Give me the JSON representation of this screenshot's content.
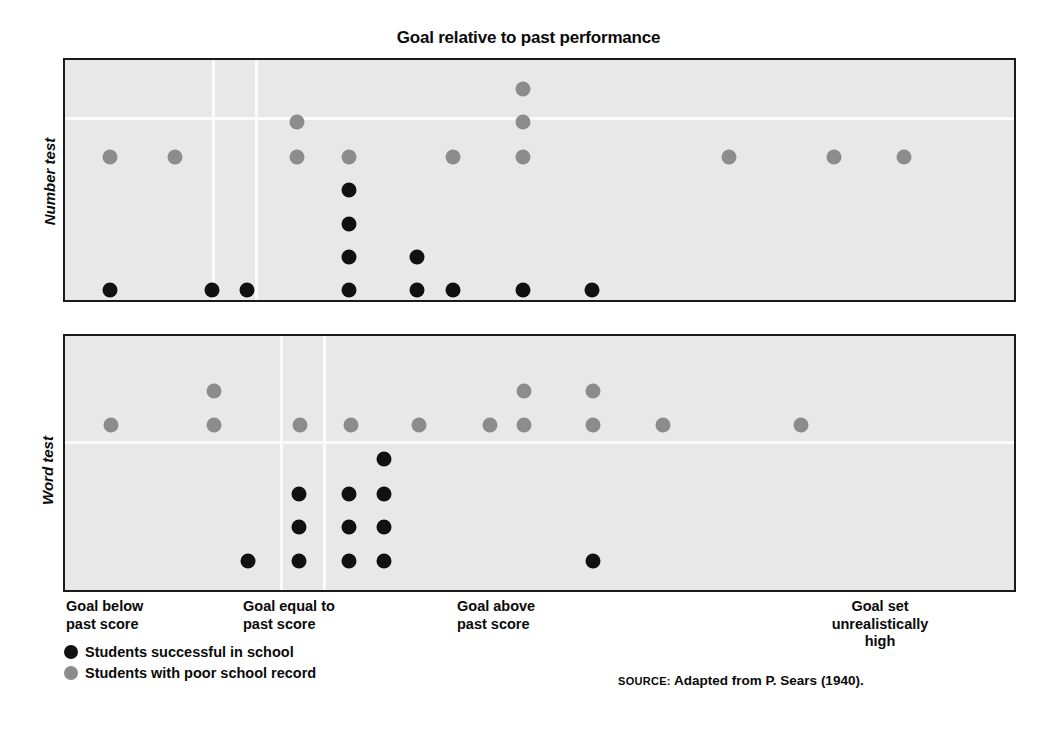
{
  "figure": {
    "title": "Goal relative to past performance",
    "source_kicker": "SOURCE:",
    "source_text": "Adapted from P. Sears (1940)."
  },
  "legend": {
    "items": [
      {
        "key": "success",
        "label": "Students successful in school",
        "color": "#111111"
      },
      {
        "key": "poor",
        "label": "Students with poor school record",
        "color": "#8c8c8c"
      }
    ]
  },
  "axis": {
    "y_labels": [
      "Number test",
      "Word test"
    ],
    "x_categories": [
      "Goal below\npast score",
      "Goal equal to\npast score",
      "Goal above\npast score",
      "Goal set\nunrealistically\nhigh"
    ]
  },
  "colors": {
    "panel_background": "#e8e8e8",
    "panel_border": "#1a1a1a",
    "gridline": "#fbfbfb",
    "success_dot": "#111111",
    "poor_dot": "#8c8c8c",
    "page_background": "#ffffff"
  },
  "chart_data": {
    "type": "scatter",
    "title": "Goal relative to past performance",
    "xlabel": "Goal relative to past performance",
    "ylabel": "",
    "grid": true,
    "legend_position": "bottom-left",
    "x_axis": {
      "ticks": [
        0,
        1,
        2,
        3
      ],
      "tick_labels": [
        "Goal below past score",
        "Goal equal to past score",
        "Goal above past score",
        "Goal set unrealistically high"
      ],
      "tick_px": [
        110,
        297,
        470,
        880
      ],
      "divider_px": [
        275,
        318
      ]
    },
    "panels": [
      {
        "name": "Number test",
        "box_px": {
          "left": 63,
          "top": 58,
          "width": 953,
          "height": 244
        },
        "hgrid_px": [
          117
        ],
        "vgrid_px": [
          212,
          255
        ],
        "series": [
          {
            "name": "Students with poor school record",
            "key": "poor",
            "color": "#8c8c8c",
            "points": [
              {
                "x_px": 110,
                "y_px": 157
              },
              {
                "x_px": 175,
                "y_px": 157
              },
              {
                "x_px": 297,
                "y_px": 157
              },
              {
                "x_px": 297,
                "y_px": 122
              },
              {
                "x_px": 349,
                "y_px": 157
              },
              {
                "x_px": 453,
                "y_px": 157
              },
              {
                "x_px": 523,
                "y_px": 157
              },
              {
                "x_px": 523,
                "y_px": 122
              },
              {
                "x_px": 523,
                "y_px": 89
              },
              {
                "x_px": 729,
                "y_px": 157
              },
              {
                "x_px": 834,
                "y_px": 157
              },
              {
                "x_px": 904,
                "y_px": 157
              }
            ]
          },
          {
            "name": "Students successful in school",
            "key": "success",
            "color": "#111111",
            "points": [
              {
                "x_px": 110,
                "y_px": 290
              },
              {
                "x_px": 212,
                "y_px": 290
              },
              {
                "x_px": 247,
                "y_px": 290
              },
              {
                "x_px": 349,
                "y_px": 290
              },
              {
                "x_px": 349,
                "y_px": 257
              },
              {
                "x_px": 349,
                "y_px": 224
              },
              {
                "x_px": 349,
                "y_px": 190
              },
              {
                "x_px": 417,
                "y_px": 290
              },
              {
                "x_px": 417,
                "y_px": 257
              },
              {
                "x_px": 453,
                "y_px": 290
              },
              {
                "x_px": 523,
                "y_px": 290
              },
              {
                "x_px": 592,
                "y_px": 290
              }
            ]
          }
        ]
      },
      {
        "name": "Word test",
        "box_px": {
          "left": 63,
          "top": 334,
          "width": 953,
          "height": 258
        },
        "hgrid_px": [
          441
        ],
        "vgrid_px": [
          280,
          323
        ],
        "series": [
          {
            "name": "Students with poor school record",
            "key": "poor",
            "color": "#8c8c8c",
            "points": [
              {
                "x_px": 111,
                "y_px": 425
              },
              {
                "x_px": 214,
                "y_px": 425
              },
              {
                "x_px": 214,
                "y_px": 391
              },
              {
                "x_px": 300,
                "y_px": 425
              },
              {
                "x_px": 351,
                "y_px": 425
              },
              {
                "x_px": 419,
                "y_px": 425
              },
              {
                "x_px": 490,
                "y_px": 425
              },
              {
                "x_px": 524,
                "y_px": 425
              },
              {
                "x_px": 524,
                "y_px": 391
              },
              {
                "x_px": 593,
                "y_px": 425
              },
              {
                "x_px": 593,
                "y_px": 391
              },
              {
                "x_px": 663,
                "y_px": 425
              },
              {
                "x_px": 801,
                "y_px": 425
              }
            ]
          },
          {
            "name": "Students successful in school",
            "key": "success",
            "color": "#111111",
            "points": [
              {
                "x_px": 248,
                "y_px": 561
              },
              {
                "x_px": 299,
                "y_px": 561
              },
              {
                "x_px": 299,
                "y_px": 527
              },
              {
                "x_px": 299,
                "y_px": 494
              },
              {
                "x_px": 349,
                "y_px": 561
              },
              {
                "x_px": 349,
                "y_px": 527
              },
              {
                "x_px": 349,
                "y_px": 494
              },
              {
                "x_px": 384,
                "y_px": 561
              },
              {
                "x_px": 384,
                "y_px": 527
              },
              {
                "x_px": 384,
                "y_px": 494
              },
              {
                "x_px": 384,
                "y_px": 459
              },
              {
                "x_px": 593,
                "y_px": 561
              }
            ]
          }
        ]
      }
    ]
  }
}
